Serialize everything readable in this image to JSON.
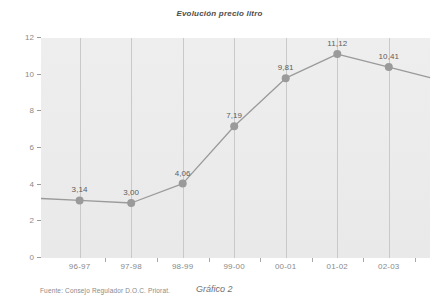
{
  "chart_data": {
    "type": "line",
    "title": "Evolución precio litro",
    "xlabel": "",
    "ylabel": "",
    "categories": [
      "96-97",
      "97-98",
      "98-99",
      "99-00",
      "00-01",
      "01-02",
      "02-03"
    ],
    "values": [
      3.14,
      3.0,
      4.06,
      7.19,
      9.81,
      11.12,
      10.41
    ],
    "point_labels": [
      "3,14",
      "3,00",
      "4,06",
      "7,19",
      "9,81",
      "11,12",
      "10,41"
    ],
    "ylim": [
      0,
      12
    ],
    "yticks": [
      0,
      2,
      4,
      6,
      8,
      10,
      12
    ],
    "ytick_labels": [
      "0",
      "2",
      "4",
      "6",
      "8",
      "10",
      "12"
    ],
    "grid": "vertical",
    "legend": "none",
    "series": [
      {
        "name": "Precio litro",
        "values": [
          3.14,
          3.0,
          4.06,
          7.19,
          9.81,
          11.12,
          10.41
        ],
        "color": "#9a9a9a",
        "marker": "circle",
        "marker_color": "#9a9a9a"
      }
    ]
  },
  "footer": {
    "source": "Fuente: Consejo Regulador D.O.C. Priorat.",
    "caption": "Gráfico 2"
  },
  "colors": {
    "plot_background": "#ececec",
    "gridline": "#c9c9c9",
    "line": "#9a9a9a",
    "marker": "#9a9a9a",
    "tick_text": "#8a8a8a",
    "label_text": "#5c5c5c"
  }
}
